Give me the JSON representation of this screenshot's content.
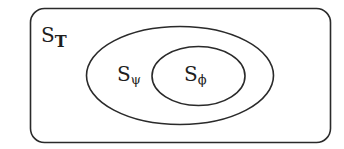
{
  "diagram": {
    "type": "nested-sets",
    "colors": {
      "stroke": "#2a2a2a",
      "background": "#ffffff"
    },
    "sets": [
      {
        "id": "T",
        "label_main": "S",
        "label_sub": "T",
        "shape": "rounded-rectangle"
      },
      {
        "id": "psi",
        "label_main": "S",
        "label_sub": "ψ",
        "shape": "ellipse",
        "inside": "T"
      },
      {
        "id": "phi",
        "label_main": "S",
        "label_sub": "ϕ",
        "shape": "ellipse",
        "inside": "psi"
      }
    ]
  }
}
